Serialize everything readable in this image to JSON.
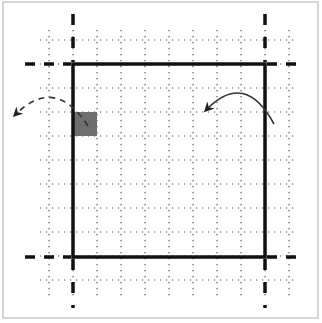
{
  "diagram": {
    "colors": {
      "background": "#ffffff",
      "frame": "#c8c8c8",
      "grid": "#555555",
      "boundary": "#111111",
      "shaded_cell": "#6e6e6e",
      "arrow_dashed": "#333333",
      "arrow_solid": "#333333"
    },
    "frame": {
      "x": 3,
      "y": 2,
      "w": 315,
      "h": 316
    },
    "grid": {
      "spacing": 24,
      "vertical_x": [
        49,
        73,
        97,
        121,
        145,
        169,
        193,
        217,
        241,
        265,
        289
      ],
      "horizontal_y": [
        40,
        64,
        88,
        112,
        136,
        160,
        184,
        208,
        232,
        256,
        280
      ],
      "v_extent": [
        30,
        296
      ],
      "h_extent": [
        40,
        298
      ]
    },
    "boundary_square": {
      "x1": 73,
      "y1": 64,
      "x2": 265,
      "y2": 257,
      "stroke_width": 3.5
    },
    "dashed_extensions": {
      "vertical": [
        {
          "x": 73,
          "top": [
            14,
            62
          ],
          "bottom": [
            259,
            308
          ]
        },
        {
          "x": 265,
          "top": [
            14,
            62
          ],
          "bottom": [
            259,
            308
          ]
        }
      ],
      "horizontal": [
        {
          "y": 64,
          "left": [
            25,
            71
          ],
          "right": [
            267,
            302
          ]
        },
        {
          "y": 257,
          "left": [
            25,
            71
          ],
          "right": [
            267,
            302
          ]
        }
      ]
    },
    "shaded_cell": {
      "x": 73,
      "y": 112,
      "w": 24,
      "h": 24
    },
    "arrows": [
      {
        "name": "left-wrap-arrow",
        "style": "dashed",
        "path": "M 88 126 Q 55 75 15 115",
        "head_at": [
          13,
          117
        ]
      },
      {
        "name": "right-wrap-arrow",
        "style": "solid",
        "path": "M 274 124 Q 245 70 206 110",
        "head_at": [
          204,
          114
        ]
      }
    ]
  }
}
